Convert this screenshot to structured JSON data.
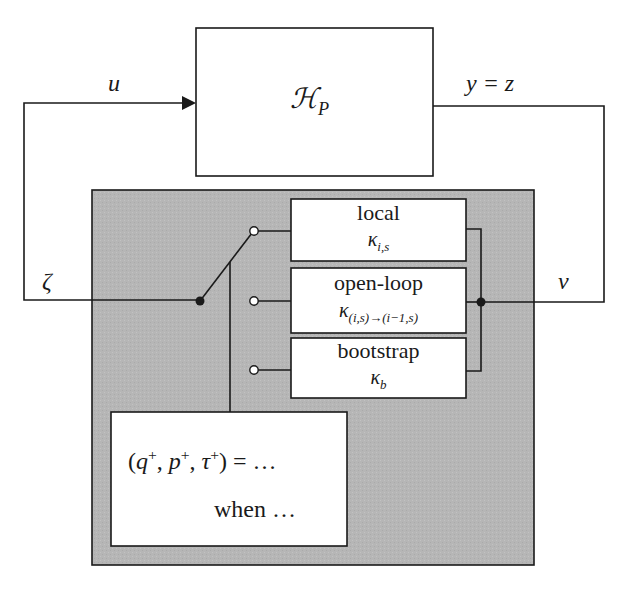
{
  "diagram": {
    "type": "block-diagram",
    "plant": {
      "label_main": "ℋ",
      "label_sub": "P"
    },
    "signals": {
      "input": "u",
      "output": "y = z",
      "feedback_left": "ζ",
      "feedback_right": "v"
    },
    "controller": {
      "modes": [
        {
          "name": "local",
          "symbol": "κ",
          "subscript": "i,s"
        },
        {
          "name": "open-loop",
          "symbol": "κ",
          "subscript": "(i,s)→(i−1,s)"
        },
        {
          "name": "bootstrap",
          "symbol": "κ",
          "subscript": "b"
        }
      ],
      "jump_rule": {
        "line1_open": "(",
        "vars": [
          {
            "v": "q",
            "sup": "+"
          },
          {
            "v": "p",
            "sup": "+"
          },
          {
            "v": "τ",
            "sup": "+"
          }
        ],
        "line1_close": ") = …",
        "line2": "when …"
      }
    },
    "colors": {
      "stroke": "#1a1a1a",
      "controller_fill": "#b4b4b4",
      "box_fill": "#ffffff"
    }
  }
}
